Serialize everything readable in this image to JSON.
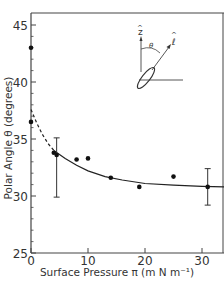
{
  "chart_data": {
    "type": "scatter",
    "title": "",
    "xlabel": "Surface Pressure π (m N m⁻¹)",
    "ylabel": "Polar Angle θ (degrees)",
    "xlim": [
      0,
      34
    ],
    "ylim": [
      25,
      46
    ],
    "x_ticks": [
      0,
      10,
      20,
      30
    ],
    "y_ticks": [
      25,
      30,
      35,
      40,
      45
    ],
    "x_tick_labels": [
      "0",
      "10",
      "20",
      "30"
    ],
    "y_tick_labels": [
      "25",
      "30",
      "35",
      "40",
      "45"
    ],
    "grid": false,
    "legend": null,
    "series": [
      {
        "name": "measured",
        "kind": "points",
        "points": [
          {
            "x": 0,
            "y": 43.0
          },
          {
            "x": 0,
            "y": 36.5
          },
          {
            "x": 4.0,
            "y": 33.8
          },
          {
            "x": 4.5,
            "y": 33.6
          },
          {
            "x": 8.0,
            "y": 33.2
          },
          {
            "x": 10.0,
            "y": 33.3
          },
          {
            "x": 14.0,
            "y": 31.6
          },
          {
            "x": 19.0,
            "y": 30.8
          },
          {
            "x": 25.0,
            "y": 31.7
          },
          {
            "x": 31.0,
            "y": 30.8
          }
        ]
      },
      {
        "name": "fit-solid",
        "kind": "line",
        "style": "solid",
        "points": [
          {
            "x": 4,
            "y": 34.0
          },
          {
            "x": 6,
            "y": 33.3
          },
          {
            "x": 8,
            "y": 32.7
          },
          {
            "x": 10,
            "y": 32.2
          },
          {
            "x": 13,
            "y": 31.7
          },
          {
            "x": 16,
            "y": 31.4
          },
          {
            "x": 20,
            "y": 31.1
          },
          {
            "x": 25,
            "y": 30.95
          },
          {
            "x": 30,
            "y": 30.85
          },
          {
            "x": 34,
            "y": 30.8
          }
        ]
      },
      {
        "name": "fit-dashed",
        "kind": "line",
        "style": "dashed",
        "points": [
          {
            "x": 0,
            "y": 37.6
          },
          {
            "x": 1,
            "y": 36.4
          },
          {
            "x": 2,
            "y": 35.4
          },
          {
            "x": 3,
            "y": 34.6
          },
          {
            "x": 4,
            "y": 34.0
          }
        ]
      }
    ],
    "error_bars": [
      {
        "x": 4.5,
        "y": 33.6,
        "low": 29.9,
        "high": 35.1
      },
      {
        "x": 31.0,
        "y": 30.8,
        "low": 29.2,
        "high": 32.4
      }
    ],
    "annotations": {
      "inset_labels": [
        "ẑ",
        "θ",
        "ℓ̂"
      ],
      "inset_description": "Molecule axis l tilted by polar angle theta from surface normal z"
    }
  },
  "labels": {
    "xlabel": "Surface Pressure π (m N m⁻¹)",
    "ylabel": "Polar Angle θ (degrees)",
    "inset_z": "z",
    "inset_theta": "θ",
    "inset_l": "ℓ"
  }
}
